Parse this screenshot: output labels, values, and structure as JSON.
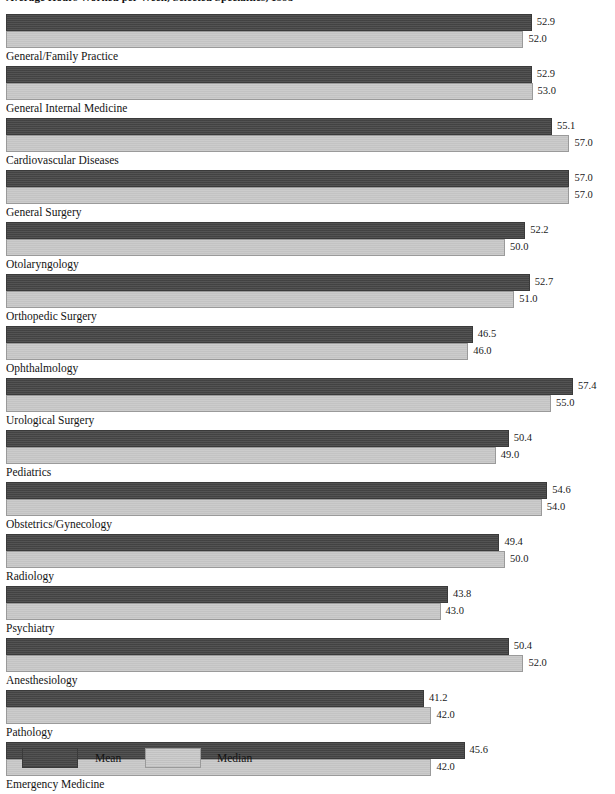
{
  "chart_data": {
    "type": "bar",
    "orientation": "horizontal",
    "title": "Average Hours Worked per Week, Selected Specialties, 1995",
    "xlabel": "",
    "ylabel": "",
    "grid": false,
    "legend_position": "bottom-left",
    "xlim": [
      40,
      58
    ],
    "axis_visible": false,
    "categories": [
      "General/Family Practice",
      "General Internal Medicine",
      "Cardiovascular Diseases",
      "General Surgery",
      "Otolaryngology",
      "Orthopedic Surgery",
      "Ophthalmology",
      "Urological Surgery",
      "Pediatrics",
      "Obstetrics/Gynecology",
      "Radiology",
      "Psychiatry",
      "Anesthesiology",
      "Pathology",
      "Emergency Medicine"
    ],
    "series": [
      {
        "name": "Mean",
        "color": "#464646",
        "values": [
          52.9,
          52.9,
          55.1,
          57.0,
          52.2,
          52.7,
          46.5,
          57.4,
          50.4,
          54.6,
          49.4,
          43.8,
          50.4,
          41.2,
          45.6
        ]
      },
      {
        "name": "Median",
        "color": "#c9c9c9",
        "values": [
          52.0,
          53.0,
          57.0,
          57.0,
          50.0,
          51.0,
          46.0,
          55.0,
          49.0,
          54.0,
          50.0,
          43.0,
          52.0,
          42.0,
          42.0
        ]
      }
    ],
    "value_label_format": "one-decimal"
  },
  "legend": {
    "mean_label": "Mean",
    "median_label": "Median"
  },
  "colors": {
    "mean": "#464646",
    "median": "#c9c9c9",
    "background": "#ffffff",
    "text": "#1a1a1a"
  },
  "scale": {
    "origin_px": 45,
    "px_per_unit": 9.2,
    "bar_left_px": 6
  }
}
